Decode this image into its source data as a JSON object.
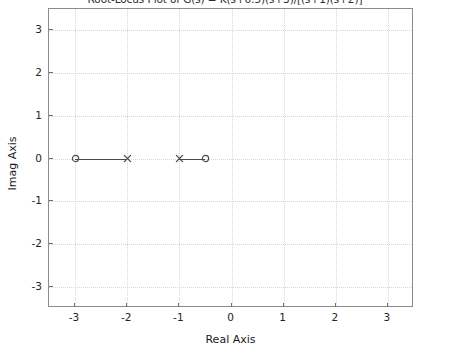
{
  "chart_data": {
    "type": "scatter",
    "title": "Root-Locus Plot of G(s) = K(s+0.5)(s+3)/[(s+1)(s+2)]",
    "xlabel": "Real Axis",
    "ylabel": "Imag Axis",
    "xlim": [
      -3.5,
      3.5
    ],
    "ylim": [
      -3.5,
      3.5
    ],
    "grid": true,
    "legend": null,
    "xticks": [
      -3,
      -2,
      -1,
      0,
      1,
      2,
      3
    ],
    "xtick_labels": [
      "-3",
      "-2",
      "-1",
      "0",
      "1",
      "2",
      "3"
    ],
    "yticks": [
      3,
      2,
      1,
      0,
      -1,
      -2,
      -3
    ],
    "ytick_labels": [
      "3",
      "2",
      "1",
      "0",
      "-1",
      "-2",
      "-3"
    ],
    "series": [
      {
        "name": "open-loop zeros",
        "marker": "circle",
        "color": "#4a4a4a",
        "points": [
          {
            "x": -3,
            "y": 0
          },
          {
            "x": -0.5,
            "y": 0
          }
        ]
      },
      {
        "name": "open-loop poles",
        "marker": "x",
        "color": "#4a4a4a",
        "points": [
          {
            "x": -2,
            "y": 0
          },
          {
            "x": -1,
            "y": 0
          }
        ]
      }
    ],
    "locus_branches": [
      {
        "name": "branch-left",
        "x_start": -3,
        "x_end": -2,
        "y": 0
      },
      {
        "name": "branch-right",
        "x_start": -1,
        "x_end": -0.5,
        "y": 0
      }
    ]
  }
}
